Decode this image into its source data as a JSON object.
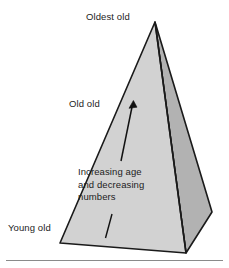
{
  "figure": {
    "type": "diagram",
    "shape": "three-dimensional-pyramid"
  },
  "labels": {
    "apex": "Oldest old",
    "middle": "Old old",
    "base": "Young old"
  },
  "annotation": {
    "line1": "Increasing age",
    "line2": "and decreasing",
    "line3": "numbers"
  },
  "arrow": {
    "name": "increasing-age-arrow",
    "direction": "up-right",
    "meaning": "Increasing age and decreasing numbers"
  },
  "colors": {
    "left_face": "#d2d2d2",
    "right_face": "#b2b2b2",
    "outline": "#1a1a1a",
    "text": "#1c1c1c",
    "background": "#ffffff",
    "rule": "#8a8a8a"
  },
  "geometry": {
    "apex": [
      155,
      22
    ],
    "base_left": [
      60,
      243
    ],
    "base_front": [
      186,
      253
    ],
    "base_right": [
      212,
      212
    ],
    "arrow_tip": [
      133,
      102
    ],
    "arrow_tail": [
      121,
      161
    ],
    "tick_top": [
      112,
      215
    ],
    "tick_bottom": [
      105,
      238
    ]
  }
}
